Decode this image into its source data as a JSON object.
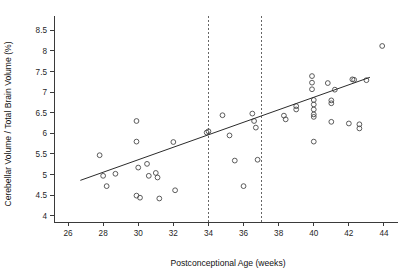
{
  "chart_data": {
    "type": "scatter",
    "title": "",
    "xlabel": "Postconceptional Age (weeks)",
    "ylabel": "Cerebellar Volume / Total Brain Volume (%)",
    "xlim": [
      25.2,
      44.8
    ],
    "ylim": [
      3.85,
      8.75
    ],
    "xticks": [
      26,
      28,
      30,
      32,
      34,
      36,
      38,
      40,
      42,
      44
    ],
    "xticklabels": [
      "26",
      "28",
      "30",
      "32",
      "34",
      "36",
      "38",
      "40",
      "42",
      "44"
    ],
    "yticks": [
      4,
      4.5,
      5,
      5.5,
      6,
      6.5,
      7,
      7.5,
      8,
      8.5
    ],
    "yticklabels": [
      "4",
      "4.5",
      "5",
      "5.5",
      "6",
      "6.5",
      "7",
      "7.5",
      "8",
      "8.5"
    ],
    "grid": false,
    "legend": "none",
    "marker": "open-circle",
    "points": [
      {
        "x": 27.8,
        "y": 5.47
      },
      {
        "x": 28.0,
        "y": 4.97
      },
      {
        "x": 28.2,
        "y": 4.72
      },
      {
        "x": 28.7,
        "y": 5.02
      },
      {
        "x": 29.9,
        "y": 6.3
      },
      {
        "x": 29.9,
        "y": 5.8
      },
      {
        "x": 29.9,
        "y": 4.49
      },
      {
        "x": 30.0,
        "y": 5.17
      },
      {
        "x": 30.1,
        "y": 4.44
      },
      {
        "x": 30.5,
        "y": 5.26
      },
      {
        "x": 30.6,
        "y": 4.97
      },
      {
        "x": 31.0,
        "y": 5.04
      },
      {
        "x": 31.1,
        "y": 4.93
      },
      {
        "x": 31.2,
        "y": 4.42
      },
      {
        "x": 32.0,
        "y": 5.79
      },
      {
        "x": 32.1,
        "y": 4.62
      },
      {
        "x": 33.9,
        "y": 6.02
      },
      {
        "x": 34.0,
        "y": 6.05
      },
      {
        "x": 34.8,
        "y": 6.44
      },
      {
        "x": 35.2,
        "y": 5.95
      },
      {
        "x": 35.5,
        "y": 5.34
      },
      {
        "x": 36.0,
        "y": 4.72
      },
      {
        "x": 36.5,
        "y": 6.48
      },
      {
        "x": 36.6,
        "y": 6.3
      },
      {
        "x": 36.7,
        "y": 6.14
      },
      {
        "x": 36.8,
        "y": 5.36
      },
      {
        "x": 38.3,
        "y": 6.43
      },
      {
        "x": 38.4,
        "y": 6.34
      },
      {
        "x": 39.0,
        "y": 6.66
      },
      {
        "x": 39.0,
        "y": 6.58
      },
      {
        "x": 39.9,
        "y": 7.39
      },
      {
        "x": 39.9,
        "y": 7.23
      },
      {
        "x": 39.9,
        "y": 7.07
      },
      {
        "x": 40.0,
        "y": 6.81
      },
      {
        "x": 40.0,
        "y": 6.7
      },
      {
        "x": 40.0,
        "y": 6.58
      },
      {
        "x": 40.0,
        "y": 6.46
      },
      {
        "x": 40.0,
        "y": 6.4
      },
      {
        "x": 40.0,
        "y": 5.8
      },
      {
        "x": 40.8,
        "y": 7.22
      },
      {
        "x": 41.0,
        "y": 6.8
      },
      {
        "x": 41.0,
        "y": 6.73
      },
      {
        "x": 41.0,
        "y": 6.28
      },
      {
        "x": 41.2,
        "y": 7.06
      },
      {
        "x": 42.0,
        "y": 6.24
      },
      {
        "x": 42.2,
        "y": 7.31
      },
      {
        "x": 42.3,
        "y": 7.3
      },
      {
        "x": 42.6,
        "y": 6.22
      },
      {
        "x": 42.6,
        "y": 6.12
      },
      {
        "x": 43.0,
        "y": 7.29
      },
      {
        "x": 43.9,
        "y": 8.12
      }
    ],
    "regression_line": {
      "x1": 26.7,
      "y1": 4.86,
      "x2": 43.2,
      "y2": 7.36
    },
    "reference_lines": [
      {
        "x": 34,
        "style": "dashed"
      },
      {
        "x": 37,
        "style": "dashed"
      }
    ]
  }
}
